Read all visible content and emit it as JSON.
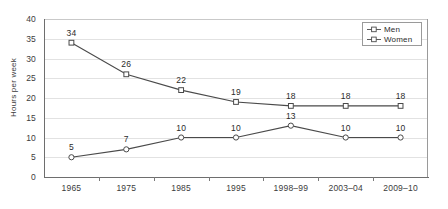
{
  "chart_data": {
    "type": "line",
    "title": "",
    "xlabel": "",
    "ylabel": "Hours per week",
    "ylim": [
      0,
      40
    ],
    "yticks": [
      0,
      5,
      10,
      15,
      20,
      25,
      30,
      35,
      40
    ],
    "grid": true,
    "legend_position": "top-right",
    "categories": [
      "1965",
      "1975",
      "1985",
      "1995",
      "1998–99",
      "2003–04",
      "2009–10"
    ],
    "series": [
      {
        "name": "Men",
        "marker": "open-square",
        "color": "#4a4a4a",
        "values": [
          34,
          26,
          22,
          19,
          18,
          18,
          18
        ],
        "labels": [
          "34",
          "26",
          "22",
          "19",
          "18",
          "18",
          "18"
        ]
      },
      {
        "name": "Women",
        "marker": "open-circle",
        "color": "#4a4a4a",
        "values": [
          5,
          7,
          10,
          10,
          13,
          10,
          10
        ],
        "labels": [
          "5",
          "7",
          "10",
          "10",
          "13",
          "10",
          "10"
        ]
      }
    ]
  },
  "legend": {
    "items": [
      {
        "label": "Men"
      },
      {
        "label": "Women"
      }
    ]
  },
  "axes": {
    "y_title": "Hours per week",
    "y_tick_labels": [
      "40",
      "35",
      "30",
      "25",
      "20",
      "15",
      "10",
      "5",
      "0"
    ],
    "x_tick_labels": [
      "1965",
      "1975",
      "1985",
      "1995",
      "1998–99",
      "2003–04",
      "2009–10"
    ]
  },
  "colors": {
    "background": "#ffffff",
    "gridline": "#e2e2e2",
    "axis": "#6e6e6e",
    "series_line": "#4a4a4a",
    "label_text": "#2b2b2b"
  }
}
